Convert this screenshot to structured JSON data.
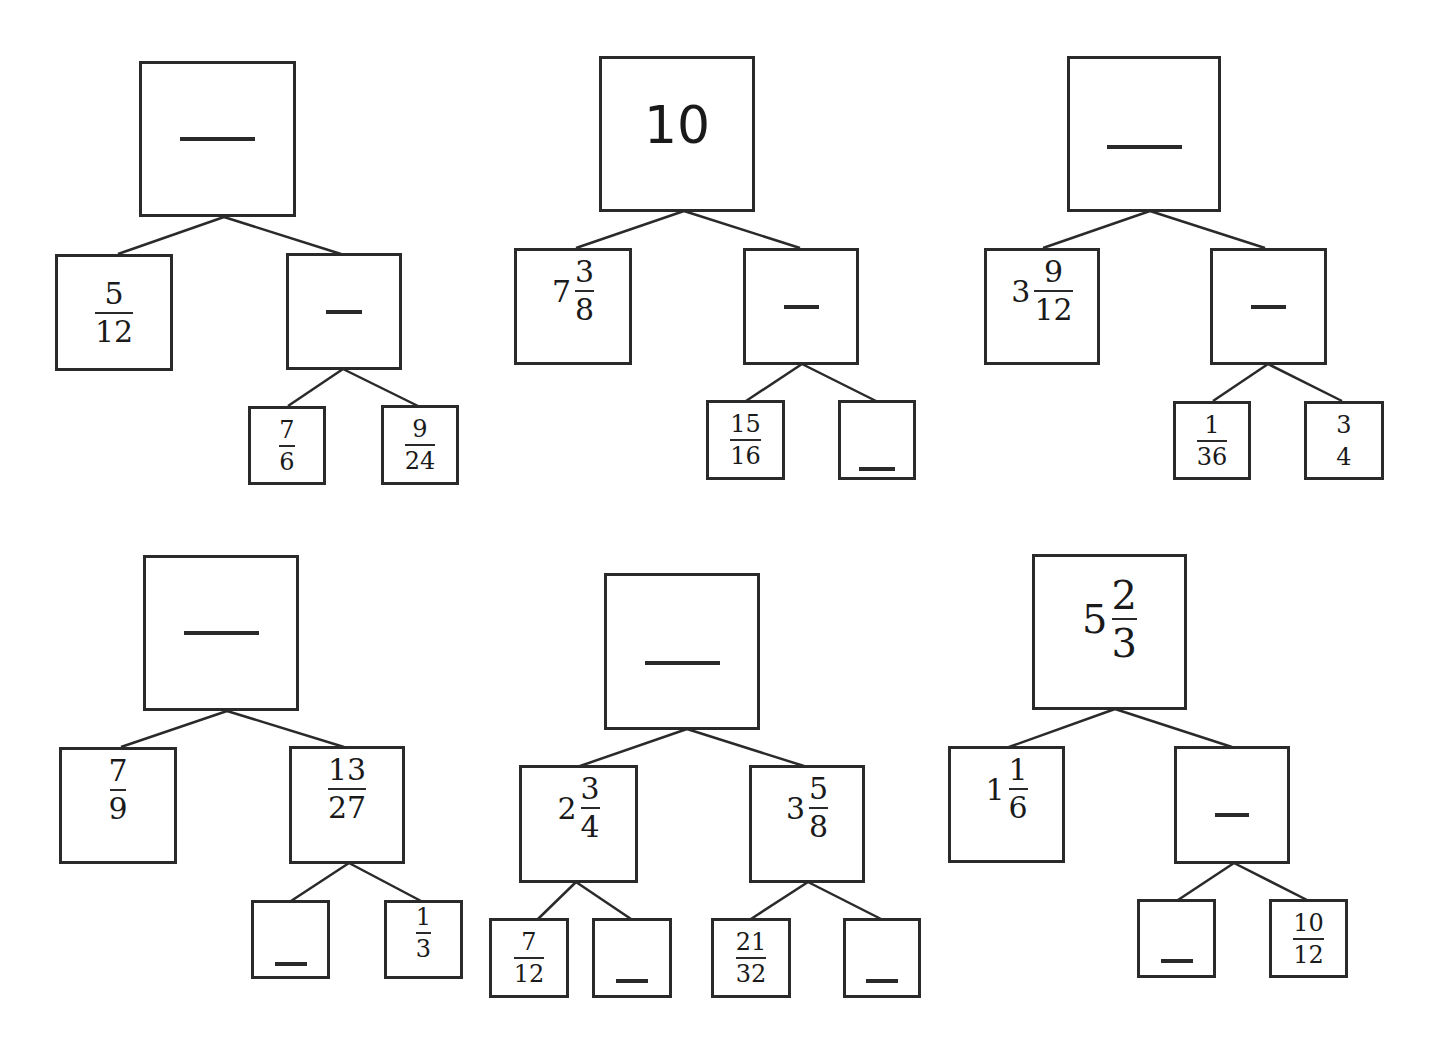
{
  "worksheet": {
    "line_color": "#2a2a2a",
    "trees": [
      {
        "id": "tree-1",
        "root": {
          "type": "blank"
        },
        "left": {
          "type": "fraction",
          "num": "5",
          "den": "12"
        },
        "right": {
          "type": "blank"
        },
        "right_children": [
          {
            "type": "fraction",
            "num": "7",
            "den": "6"
          },
          {
            "type": "fraction",
            "num": "9",
            "den": "24"
          }
        ]
      },
      {
        "id": "tree-2",
        "root": {
          "type": "integer",
          "value": "10"
        },
        "left": {
          "type": "mixed",
          "whole": "7",
          "num": "3",
          "den": "8"
        },
        "right": {
          "type": "blank"
        },
        "right_children": [
          {
            "type": "fraction",
            "num": "15",
            "den": "16"
          },
          {
            "type": "blank"
          }
        ]
      },
      {
        "id": "tree-3",
        "root": {
          "type": "blank"
        },
        "left": {
          "type": "mixed",
          "whole": "3",
          "num": "9",
          "den": "12"
        },
        "right": {
          "type": "blank"
        },
        "right_children": [
          {
            "type": "fraction",
            "num": "1",
            "den": "36"
          },
          {
            "type": "fraction",
            "num": "3",
            "den": "4"
          }
        ]
      },
      {
        "id": "tree-4",
        "root": {
          "type": "blank"
        },
        "left": {
          "type": "fraction",
          "num": "7",
          "den": "9"
        },
        "right": {
          "type": "fraction",
          "num": "13",
          "den": "27"
        },
        "right_children": [
          {
            "type": "blank"
          },
          {
            "type": "fraction",
            "num": "1",
            "den": "3"
          }
        ]
      },
      {
        "id": "tree-5",
        "root": {
          "type": "blank"
        },
        "left": {
          "type": "mixed",
          "whole": "2",
          "num": "3",
          "den": "4"
        },
        "right": {
          "type": "mixed",
          "whole": "3",
          "num": "5",
          "den": "8"
        },
        "left_children": [
          {
            "type": "fraction",
            "num": "7",
            "den": "12"
          },
          {
            "type": "blank"
          }
        ],
        "right_children": [
          {
            "type": "fraction",
            "num": "21",
            "den": "32"
          },
          {
            "type": "blank"
          }
        ]
      },
      {
        "id": "tree-6",
        "root": {
          "type": "mixed",
          "whole": "5",
          "num": "2",
          "den": "3"
        },
        "left": {
          "type": "mixed",
          "whole": "1",
          "num": "1",
          "den": "6"
        },
        "right": {
          "type": "blank"
        },
        "right_children": [
          {
            "type": "blank"
          },
          {
            "type": "fraction",
            "num": "10",
            "den": "12"
          }
        ]
      }
    ]
  }
}
